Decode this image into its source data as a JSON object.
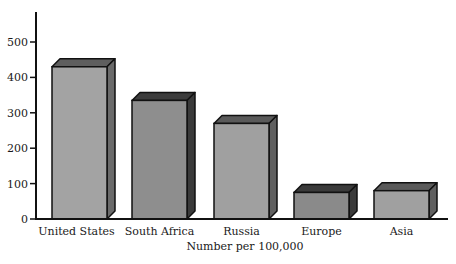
{
  "chart_data": {
    "type": "bar",
    "style": "3d-column",
    "title": "",
    "xlabel": "Number per 100,000",
    "ylabel": "",
    "categories": [
      "United States",
      "South Africa",
      "Russia",
      "Europe",
      "Asia"
    ],
    "values": [
      430,
      335,
      270,
      75,
      80
    ],
    "ylim": [
      0,
      550
    ],
    "yticks": [
      0,
      100,
      200,
      300,
      400,
      500
    ],
    "grid": false,
    "legend": null,
    "colors": {
      "front": [
        "#a3a3a3",
        "#8e8e8e",
        "#a0a0a0",
        "#8a8a8a",
        "#a0a0a0"
      ],
      "top": [
        "#5e5e5e",
        "#3c3c3c",
        "#5a5a5a",
        "#3a3a3a",
        "#5a5a5a"
      ],
      "side": [
        "#6a6a6a",
        "#3a3a3a",
        "#606060",
        "#3a3a3a",
        "#606060"
      ],
      "outline": "#111111",
      "axis": "#111111"
    }
  }
}
